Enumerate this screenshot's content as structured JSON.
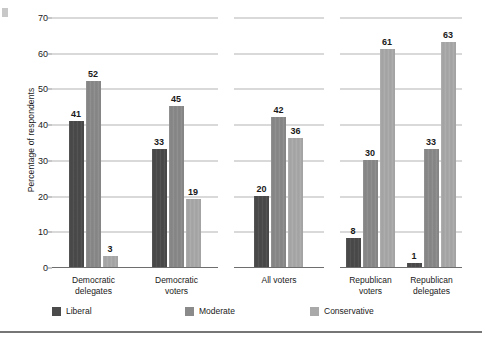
{
  "chart_data": {
    "type": "bar",
    "title": "",
    "xlabel": "",
    "ylabel": "Percentage of respondents",
    "ylim": [
      0,
      70
    ],
    "yticks": [
      0,
      10,
      20,
      30,
      40,
      50,
      60,
      70
    ],
    "grid": true,
    "legend_position": "bottom-left",
    "categories": [
      "Democratic delegates",
      "Democratic voters",
      "All voters",
      "Republican voters",
      "Republican delegates"
    ],
    "category_lines": [
      [
        "Democratic",
        "delegates"
      ],
      [
        "Democratic",
        "voters"
      ],
      [
        "All voters"
      ],
      [
        "Republican",
        "voters"
      ],
      [
        "Republican",
        "delegates"
      ]
    ],
    "series": [
      {
        "name": "Liberal",
        "color": "#4b4b4b",
        "values": [
          41,
          33,
          20,
          8,
          1
        ]
      },
      {
        "name": "Moderate",
        "color": "#8a8a8a",
        "values": [
          52,
          45,
          42,
          30,
          33
        ]
      },
      {
        "name": "Conservative",
        "color": "#a9a9a9",
        "values": [
          3,
          19,
          36,
          61,
          63
        ]
      }
    ],
    "panels": [
      {
        "name": "democratic-panel",
        "categories": [
          "Democratic delegates",
          "Democratic voters"
        ]
      },
      {
        "name": "all-voters-panel",
        "categories": [
          "All voters"
        ]
      },
      {
        "name": "republican-panel",
        "categories": [
          "Republican voters",
          "Republican delegates"
        ]
      }
    ]
  },
  "axis": {
    "y_title": "Percentage of respondents",
    "tick_labels": [
      "0",
      "10",
      "20",
      "30",
      "40",
      "50",
      "60",
      "70"
    ]
  },
  "legend": {
    "items": [
      {
        "label": "Liberal",
        "color": "#4b4b4b"
      },
      {
        "label": "Moderate",
        "color": "#8a8a8a"
      },
      {
        "label": "Conservative",
        "color": "#a9a9a9"
      }
    ]
  },
  "values_flat": {
    "democratic_delegates": {
      "liberal": 41,
      "moderate": 52,
      "conservative": 3
    },
    "democratic_voters": {
      "liberal": 33,
      "moderate": 45,
      "conservative": 19
    },
    "all_voters": {
      "liberal": 20,
      "moderate": 42,
      "conservative": 36
    },
    "republican_voters": {
      "liberal": 8,
      "moderate": 30,
      "conservative": 61
    },
    "republican_delegates": {
      "liberal": 1,
      "moderate": 33,
      "conservative": 63
    }
  }
}
